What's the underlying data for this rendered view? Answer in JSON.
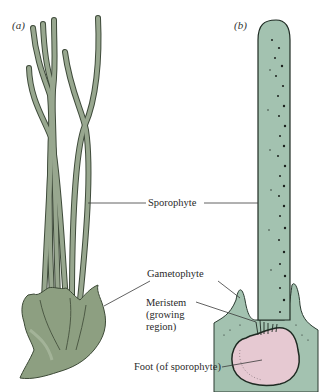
{
  "figure": {
    "panels": [
      {
        "id": "a",
        "label": "(a)"
      },
      {
        "id": "b",
        "label": "(b)"
      }
    ],
    "labels": {
      "sporophyte": "Sporophyte",
      "gametophyte": "Gametophyte",
      "meristem_line1": "Meristem",
      "meristem_line2": "(growing",
      "meristem_line3": "region)",
      "foot": "Foot (of sporophyte)"
    },
    "colors": {
      "sporophyte_left": "#8f9e86",
      "gametophyte_left": "#8a9c7e",
      "tissue_right": "#9fbfad",
      "foot_fill": "#e6c9d2",
      "outline": "#1e2a22",
      "dots": "#1a1f1c"
    }
  }
}
